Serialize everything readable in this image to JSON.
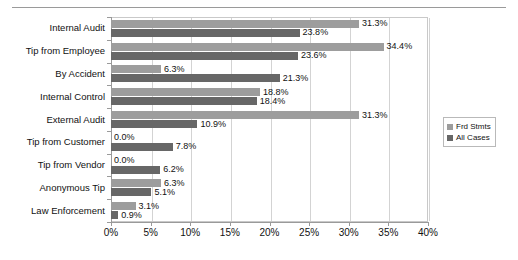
{
  "chart_data": {
    "type": "bar",
    "orientation": "horizontal",
    "title": "",
    "subtitle": "",
    "xlabel": "",
    "ylabel": "",
    "xlim": [
      0,
      40
    ],
    "xtick_labels": [
      "0%",
      "5%",
      "10%",
      "15%",
      "20%",
      "25%",
      "30%",
      "35%",
      "40%"
    ],
    "xticks": [
      0,
      5,
      10,
      15,
      20,
      25,
      30,
      35,
      40
    ],
    "grid": true,
    "legend_position": "right",
    "categories": [
      "Internal Audit",
      "Tip from Employee",
      "By Accident",
      "Internal Control",
      "External Audit",
      "Tip from Customer",
      "Tip from Vendor",
      "Anonymous Tip",
      "Law Enforcement"
    ],
    "series": [
      {
        "name": "Frd Stmts",
        "color": "#9d9d9d",
        "values": [
          31.3,
          34.4,
          6.3,
          18.8,
          31.3,
          0.0,
          0.0,
          6.3,
          3.1
        ],
        "labels": [
          "31.3%",
          "34.4%",
          "6.3%",
          "18.8%",
          "31.3%",
          "0.0%",
          "0.0%",
          "6.3%",
          "3.1%"
        ]
      },
      {
        "name": "All Cases",
        "color": "#676767",
        "values": [
          23.8,
          23.6,
          21.3,
          18.4,
          10.9,
          7.8,
          6.2,
          5.1,
          0.9
        ],
        "labels": [
          "23.8%",
          "23.6%",
          "21.3%",
          "18.4%",
          "10.9%",
          "7.8%",
          "6.2%",
          "5.1%",
          "0.9%"
        ]
      }
    ]
  },
  "legend": {
    "items": [
      {
        "label": "Frd Stmts"
      },
      {
        "label": "All Cases"
      }
    ]
  }
}
